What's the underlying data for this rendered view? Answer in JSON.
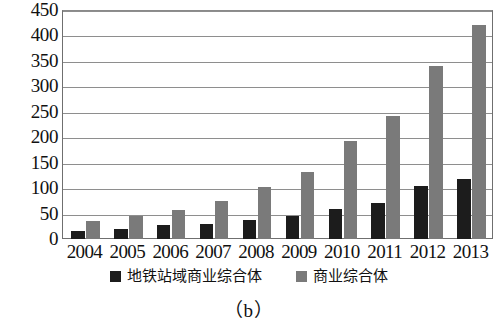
{
  "caption": "（b）",
  "legend": {
    "position": "bottom-center",
    "items": [
      {
        "label": "地铁站域商业综合体",
        "color": "#1c1c1c",
        "swatch": "black"
      },
      {
        "label": "商业综合体",
        "color": "#7a7a7a",
        "swatch": "gray"
      }
    ]
  },
  "chart_data": {
    "type": "bar",
    "title": "",
    "subtitle": "",
    "xlabel": "",
    "ylabel": "",
    "categories": [
      "2004",
      "2005",
      "2006",
      "2007",
      "2008",
      "2009",
      "2010",
      "2011",
      "2012",
      "2013"
    ],
    "series": [
      {
        "name": "地铁站域商业综合体",
        "color": "#1c1c1c",
        "values": [
          15,
          20,
          28,
          30,
          38,
          45,
          60,
          72,
          105,
          118
        ]
      },
      {
        "name": "商业综合体",
        "color": "#7a7a7a",
        "values": [
          35,
          45,
          58,
          75,
          103,
          132,
          193,
          243,
          342,
          422
        ]
      }
    ],
    "ylim": [
      0,
      450
    ],
    "ytick_step": 50,
    "yticks": [
      0,
      50,
      100,
      150,
      200,
      250,
      300,
      350,
      400,
      450
    ],
    "ytick_labels": [
      "0",
      "50",
      "100",
      "150",
      "200",
      "250",
      "300",
      "350",
      "400",
      "450"
    ],
    "grid": true,
    "grid_axis": "y",
    "legend_position": "bottom"
  }
}
